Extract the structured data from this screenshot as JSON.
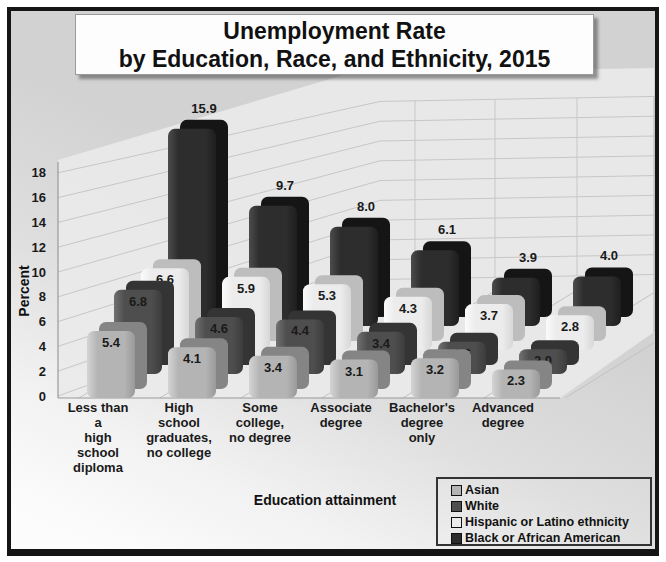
{
  "title": {
    "line1": "Unemployment Rate",
    "line2": "by Education, Race, and Ethnicity, 2015"
  },
  "chart_data": {
    "type": "bar",
    "projection": "3d-column",
    "title": "Unemployment Rate by Education, Race, and Ethnicity, 2015",
    "xlabel": "Education attainment",
    "ylabel": "Percent",
    "ylim": [
      0,
      18
    ],
    "yticks": [
      0,
      2,
      4,
      6,
      8,
      10,
      12,
      14,
      16,
      18
    ],
    "grid": true,
    "legend_position": "bottom-right",
    "categories": [
      "Less than a high school diploma",
      "High school graduates, no college",
      "Some college, no degree",
      "Associate degree",
      "Bachelor's degree only",
      "Advanced degree"
    ],
    "categories_lines": [
      [
        "Less than",
        "a",
        "high",
        "school",
        "diploma"
      ],
      [
        "High",
        "school",
        "graduates,",
        "no college"
      ],
      [
        "Some",
        "college,",
        "no degree"
      ],
      [
        "Associate",
        "degree"
      ],
      [
        "Bachelor's",
        "degree",
        "only"
      ],
      [
        "Advanced",
        "degree"
      ]
    ],
    "series": [
      {
        "name": "Asian",
        "values": [
          5.4,
          4.1,
          3.4,
          3.1,
          3.2,
          2.3
        ],
        "color": "#b4b4b4",
        "color_light": "#d4d4d4",
        "color_dark": "#9a9a9a",
        "side_color": "#858585",
        "label_color": "#1a1a1a"
      },
      {
        "name": "White",
        "values": [
          6.8,
          4.6,
          4.4,
          3.4,
          2.6,
          2.0
        ],
        "color": "#4e4e4e",
        "color_light": "#707070",
        "color_dark": "#3c3c3c",
        "side_color": "#343434",
        "label_color": "#ffffff"
      },
      {
        "name": "Hispanic or Latino ethnicity",
        "values": [
          6.6,
          5.9,
          5.3,
          4.3,
          3.7,
          2.8
        ],
        "color": "#ececec",
        "color_light": "#fbfbfb",
        "color_dark": "#d7d7d7",
        "side_color": "#bdbdbd",
        "label_color": "#1a1a1a"
      },
      {
        "name": "Black or African American",
        "values": [
          15.9,
          9.7,
          8.0,
          6.1,
          3.9,
          4.0
        ],
        "color": "#2d2d2d",
        "color_light": "#4c4c4c",
        "color_dark": "#1e1e1e",
        "side_color": "#151515",
        "label_color": "#1a1a1a"
      }
    ],
    "value_label_format": "one-decimal"
  },
  "legend_swatch_border": "#111111"
}
